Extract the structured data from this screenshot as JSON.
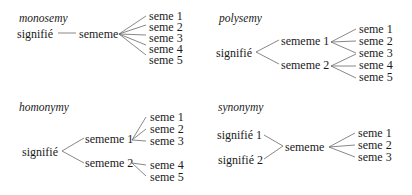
{
  "diagram": {
    "panels": [
      {
        "id": "monosemy",
        "title": "monosemy",
        "signifies": [
          "signifié"
        ],
        "sememes": [
          "sememe"
        ],
        "semes": [
          "seme 1",
          "seme 2",
          "seme 3",
          "seme 4",
          "seme 5"
        ],
        "links": [
          [
            "signifié",
            "sememe"
          ],
          [
            "sememe",
            "seme 1"
          ],
          [
            "sememe",
            "seme 2"
          ],
          [
            "sememe",
            "seme 3"
          ],
          [
            "sememe",
            "seme 4"
          ],
          [
            "sememe",
            "seme 5"
          ]
        ]
      },
      {
        "id": "polysemy",
        "title": "polysemy",
        "signifies": [
          "signifié"
        ],
        "sememes": [
          "sememe 1",
          "sememe 2"
        ],
        "semes": [
          "seme 1",
          "seme 2",
          "seme 3",
          "seme 4",
          "seme 5"
        ],
        "links": [
          [
            "signifié",
            "sememe 1"
          ],
          [
            "signifié",
            "sememe 2"
          ],
          [
            "sememe 1",
            "seme 1"
          ],
          [
            "sememe 1",
            "seme 2"
          ],
          [
            "sememe 1",
            "seme 3"
          ],
          [
            "sememe 2",
            "seme 3"
          ],
          [
            "sememe 2",
            "seme 4"
          ],
          [
            "sememe 2",
            "seme 5"
          ]
        ]
      },
      {
        "id": "homonymy",
        "title": "homonymy",
        "signifies": [
          "signifié"
        ],
        "sememes": [
          "sememe 1",
          "sememe 2"
        ],
        "semes": [
          "seme 1",
          "seme 2",
          "seme 3",
          "seme 4",
          "seme 5"
        ],
        "links": [
          [
            "signifié",
            "sememe 1"
          ],
          [
            "signifié",
            "sememe 2"
          ],
          [
            "sememe 1",
            "seme 1"
          ],
          [
            "sememe 1",
            "seme 2"
          ],
          [
            "sememe 1",
            "seme 3"
          ],
          [
            "sememe 2",
            "seme 4"
          ],
          [
            "sememe 2",
            "seme 5"
          ]
        ]
      },
      {
        "id": "synonymy",
        "title": "synonymy",
        "signifies": [
          "signifié 1",
          "signifié 2"
        ],
        "sememes": [
          "sememe"
        ],
        "semes": [
          "seme 1",
          "seme 2",
          "seme 3"
        ],
        "links": [
          [
            "signifié 1",
            "sememe"
          ],
          [
            "signifié 2",
            "sememe"
          ],
          [
            "sememe",
            "seme 1"
          ],
          [
            "sememe",
            "seme 2"
          ],
          [
            "sememe",
            "seme 3"
          ]
        ]
      }
    ]
  }
}
